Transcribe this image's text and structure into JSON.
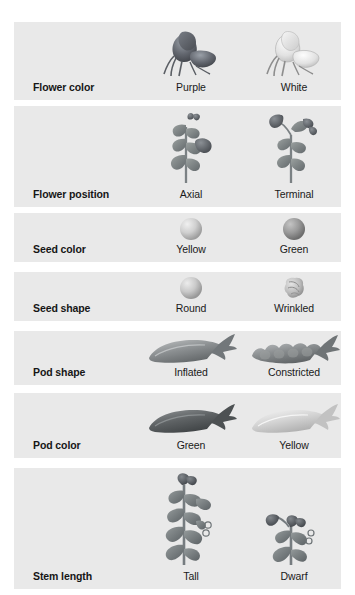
{
  "figure": {
    "ghost_text": "",
    "panel_bg": "#e9e9e9",
    "page_bg": "#ffffff"
  },
  "columns": {
    "trait_header": "Character",
    "dominant_header": "Dominant",
    "recessive_header": "Recessive"
  },
  "traits": [
    {
      "label": "Flower color",
      "variants": [
        {
          "name": "Purple",
          "icon": "purple-flower-icon",
          "color": "#6b6f78"
        },
        {
          "name": "White",
          "icon": "white-flower-icon",
          "color": "#dcdcdc"
        }
      ]
    },
    {
      "label": "Flower position",
      "variants": [
        {
          "name": "Axial",
          "icon": "axial-flower-stem-icon",
          "color": "#8b8f94"
        },
        {
          "name": "Terminal",
          "icon": "terminal-flower-stem-icon",
          "color": "#8b8f94"
        }
      ]
    },
    {
      "label": "Seed color",
      "variants": [
        {
          "name": "Yellow",
          "icon": "yellow-seed-icon",
          "color": "#c9c9c9"
        },
        {
          "name": "Green",
          "icon": "green-seed-icon",
          "color": "#9a9a9a"
        }
      ]
    },
    {
      "label": "Seed shape",
      "variants": [
        {
          "name": "Round",
          "icon": "round-seed-icon",
          "color": "#c4c4c4"
        },
        {
          "name": "Wrinkled",
          "icon": "wrinkled-seed-icon",
          "color": "#b5b5b5"
        }
      ]
    },
    {
      "label": "Pod shape",
      "variants": [
        {
          "name": "Inflated",
          "icon": "inflated-pod-icon",
          "color": "#8e8e8e"
        },
        {
          "name": "Constricted",
          "icon": "constricted-pod-icon",
          "color": "#8e8e8e"
        }
      ]
    },
    {
      "label": "Pod color",
      "variants": [
        {
          "name": "Green",
          "icon": "green-pod-icon",
          "color": "#6f6f6f"
        },
        {
          "name": "Yellow",
          "icon": "yellow-pod-icon",
          "color": "#cfcfcf"
        }
      ]
    },
    {
      "label": "Stem length",
      "variants": [
        {
          "name": "Tall",
          "icon": "tall-stem-plant-icon",
          "color": "#7d8186"
        },
        {
          "name": "Dwarf",
          "icon": "dwarf-stem-plant-icon",
          "color": "#7d8186"
        }
      ]
    }
  ]
}
